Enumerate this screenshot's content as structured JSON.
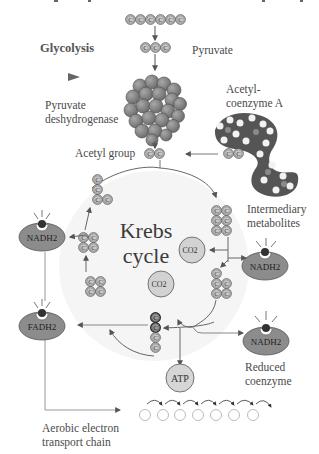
{
  "labels": {
    "glycolysis": "Glycolysis",
    "pyruvate": "Pyruvate",
    "pyruvate_dh_line1": "Pyruvate",
    "pyruvate_dh_line2": "deshydrogenase",
    "acetyl_coa_line1": "Acetyl-",
    "acetyl_coa_line2": "coenzyme A",
    "acetyl_group": "Acetyl group",
    "krebs_line1": "Krebs",
    "krebs_line2": "cycle",
    "intermediary_line1": "Intermediary",
    "intermediary_line2": "metabolites",
    "reduced_line1": "Reduced",
    "reduced_line2": "coenzyme",
    "etc_line1": "Aerobic electron",
    "etc_line2": "transport chain"
  },
  "carbon_symbol": "C",
  "molecules": {
    "nadh_left": "NADH2",
    "nadh_right": "NADH2",
    "nadh_bottom_right": "NADH2",
    "fadh": "FADH2",
    "atp": "ATP",
    "co2_a": "CO2",
    "co2_b": "CO2"
  },
  "colors": {
    "carbon_fill": "#bdbdbd",
    "carbon_stroke": "#555555",
    "coenzyme_fill": "#8a8a8a",
    "circle_fill": "#d4d4d4",
    "line": "#777777",
    "arrow": "#555555",
    "cycle_bg": "#f4f4f4"
  },
  "electron_chain": {
    "carriers": 7
  }
}
